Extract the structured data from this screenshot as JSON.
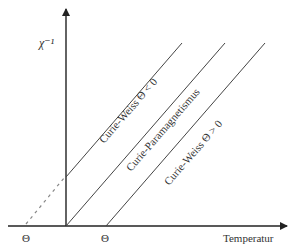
{
  "diagram": {
    "y_axis_label": "χ⁻¹",
    "x_axis_label": "Temperatur",
    "theta_neg_label": "Θ",
    "theta_pos_label": "Θ",
    "lines": [
      {
        "name": "curie-weiss-negative",
        "label": "Curie-Weiss Θ < 0"
      },
      {
        "name": "curie-paramagnetism",
        "label": "Curie-Paramagnetismus"
      },
      {
        "name": "curie-weiss-positive",
        "label": "Curie-Weiss Θ > 0"
      }
    ],
    "colors": {
      "axis": "#222222",
      "line": "#444444",
      "dashed": "#888888",
      "text": "#333333"
    }
  }
}
